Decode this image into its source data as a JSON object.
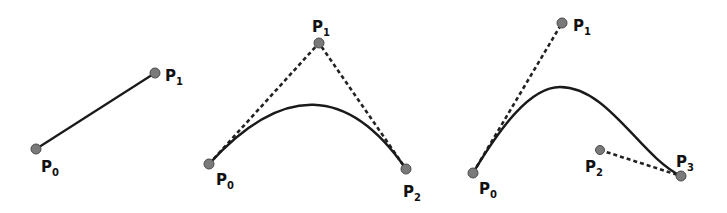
{
  "colors": {
    "background": "#ffffff",
    "curve": "#1a1a1a",
    "control_line": "#222222",
    "point_fill": "#7a7a7a",
    "point_stroke": "#4a4a4a"
  },
  "diagrams": [
    {
      "name": "linear",
      "points": [
        {
          "label": "P",
          "sub": "0",
          "x": 36,
          "y": 149,
          "lx": 41,
          "ly": 172
        },
        {
          "label": "P",
          "sub": "1",
          "x": 155,
          "y": 73,
          "lx": 165,
          "ly": 81
        }
      ]
    },
    {
      "name": "quadratic",
      "points": [
        {
          "label": "P",
          "sub": "0",
          "x": 209,
          "y": 164,
          "lx": 216,
          "ly": 185
        },
        {
          "label": "P",
          "sub": "1",
          "x": 319,
          "y": 43,
          "lx": 312,
          "ly": 32
        },
        {
          "label": "P",
          "sub": "2",
          "x": 406,
          "y": 169,
          "lx": 403,
          "ly": 197
        }
      ]
    },
    {
      "name": "cubic",
      "points": [
        {
          "label": "P",
          "sub": "0",
          "x": 473,
          "y": 173,
          "lx": 479,
          "ly": 194
        },
        {
          "label": "P",
          "sub": "1",
          "x": 562,
          "y": 23,
          "lx": 573,
          "ly": 31
        },
        {
          "label": "P",
          "sub": "2",
          "x": 600,
          "y": 150,
          "lx": 585,
          "ly": 172
        },
        {
          "label": "P",
          "sub": "3",
          "x": 681,
          "y": 176,
          "lx": 676,
          "ly": 167
        }
      ]
    }
  ]
}
